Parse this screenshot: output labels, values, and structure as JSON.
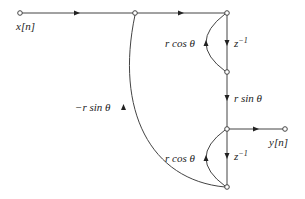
{
  "diagram": {
    "type": "signal-flow-graph",
    "colors": {
      "line": "#444444",
      "text": "#222222",
      "background": "#ffffff"
    },
    "nodes": [
      {
        "id": "input",
        "x": 20,
        "y": 13
      },
      {
        "id": "n1",
        "x": 135,
        "y": 13
      },
      {
        "id": "n2",
        "x": 227,
        "y": 13
      },
      {
        "id": "n3",
        "x": 227,
        "y": 72
      },
      {
        "id": "n4",
        "x": 227,
        "y": 129
      },
      {
        "id": "output",
        "x": 285,
        "y": 129
      },
      {
        "id": "n5",
        "x": 227,
        "y": 187
      }
    ],
    "labels": {
      "input": "x[n]",
      "output": "y[n]",
      "delay_top": "z",
      "delay_top_exp": "−1",
      "feedback_top": "r cos θ",
      "cross_gain": "r sin θ",
      "feedback_bottom": "r cos θ",
      "delay_bottom": "z",
      "delay_bottom_exp": "−1",
      "cross_feedback": "−r sin θ"
    },
    "edges": [
      {
        "from": "input",
        "to": "n1",
        "gain": ""
      },
      {
        "from": "n1",
        "to": "n2",
        "gain": ""
      },
      {
        "from": "n2",
        "to": "n3",
        "gain": "z^-1"
      },
      {
        "from": "n3",
        "to": "n2",
        "gain": "r cos θ"
      },
      {
        "from": "n3",
        "to": "n4",
        "gain": "r sin θ"
      },
      {
        "from": "n4",
        "to": "output",
        "gain": ""
      },
      {
        "from": "n4",
        "to": "n5",
        "gain": "z^-1"
      },
      {
        "from": "n5",
        "to": "n4",
        "gain": "r cos θ"
      },
      {
        "from": "n5",
        "to": "n1",
        "gain": "−r sin θ"
      }
    ]
  }
}
